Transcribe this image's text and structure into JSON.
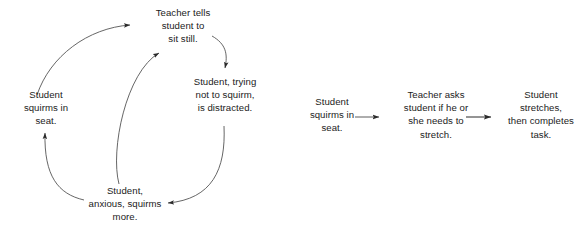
{
  "canvas": {
    "width": 588,
    "height": 237,
    "background": "#ffffff",
    "ink": "#1b1b1b"
  },
  "diagrams": [
    {
      "id": "negative-cycle",
      "type": "cycle-flow",
      "nodes": [
        {
          "id": "teacher-tells",
          "label": "Teacher tells\nstudent to\nsit still."
        },
        {
          "id": "squirms-seat",
          "label": "Student\nsquirms in\nseat."
        },
        {
          "id": "trying-not",
          "label": "Student, trying\nnot to squirm,\nis distracted."
        },
        {
          "id": "anxious-more",
          "label": "Student,\nanxious, squirms\nmore."
        }
      ],
      "edges": [
        {
          "from": "squirms-seat",
          "to": "teacher-tells",
          "style": "curved-arrow"
        },
        {
          "from": "teacher-tells",
          "to": "trying-not",
          "style": "curved-arrow"
        },
        {
          "from": "trying-not",
          "to": "anxious-more",
          "style": "curved-arrow"
        },
        {
          "from": "anxious-more",
          "to": "squirms-seat",
          "style": "curved-arrow"
        },
        {
          "from": "anxious-more",
          "to": "teacher-tells",
          "style": "curved-arrow"
        }
      ]
    },
    {
      "id": "positive-sequence",
      "type": "linear-flow",
      "nodes": [
        {
          "id": "lin-squirms",
          "label": "Student\nsquirms in\nseat."
        },
        {
          "id": "lin-teacher",
          "label": "Teacher asks\nstudent if he or\nshe needs to\nstretch."
        },
        {
          "id": "lin-stretches",
          "label": "Student\nstretches,\nthen completes\ntask."
        }
      ],
      "edges": [
        {
          "from": "lin-squirms",
          "to": "lin-teacher",
          "style": "straight-arrow"
        },
        {
          "from": "lin-teacher",
          "to": "lin-stretches",
          "style": "straight-arrow"
        }
      ]
    }
  ]
}
